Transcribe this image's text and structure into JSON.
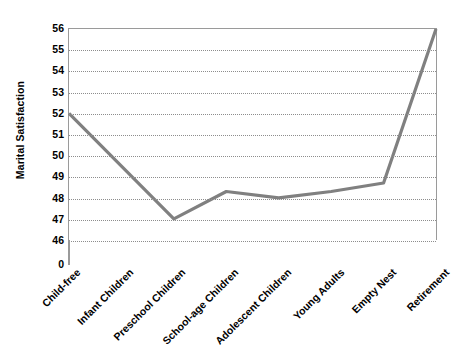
{
  "chart_data": {
    "type": "line",
    "title": "",
    "xlabel": "",
    "ylabel": "Marital Satisfaction",
    "categories": [
      "Child-free",
      "Infant Children",
      "Preschool Children",
      "School-age Children",
      "Adolescent Children",
      "Young Adults",
      "Empty Nest",
      "Retirement"
    ],
    "values": [
      52,
      49.5,
      47,
      48.3,
      48,
      48.3,
      48.7,
      56
    ],
    "series": [
      {
        "name": "Marital Satisfaction",
        "values": [
          52,
          49.5,
          47,
          48.3,
          48,
          48.3,
          48.7,
          56
        ]
      }
    ],
    "ylim": [
      46,
      56
    ],
    "y_ticks": [
      56,
      55,
      54,
      53,
      52,
      51,
      50,
      49,
      48,
      47,
      46,
      0
    ],
    "y_axis_broken": true,
    "grid": true,
    "legend": false,
    "line_color": "#808080",
    "gridline_color": "#8d8d8d",
    "axis_color": "#9a9a9a",
    "background_color": "#ffffff"
  }
}
